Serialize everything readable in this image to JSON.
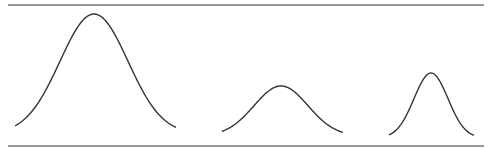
{
  "figure": {
    "line_color": "#333333",
    "rule_color": "#777777",
    "curves": [
      {
        "name": "wide-tall-curve",
        "relative_height": 1.0,
        "relative_spread": 1.0
      },
      {
        "name": "medium-low-curve",
        "relative_height": 0.41,
        "relative_spread": 0.78
      },
      {
        "name": "narrow-curve",
        "relative_height": 0.53,
        "relative_spread": 0.5
      }
    ]
  }
}
